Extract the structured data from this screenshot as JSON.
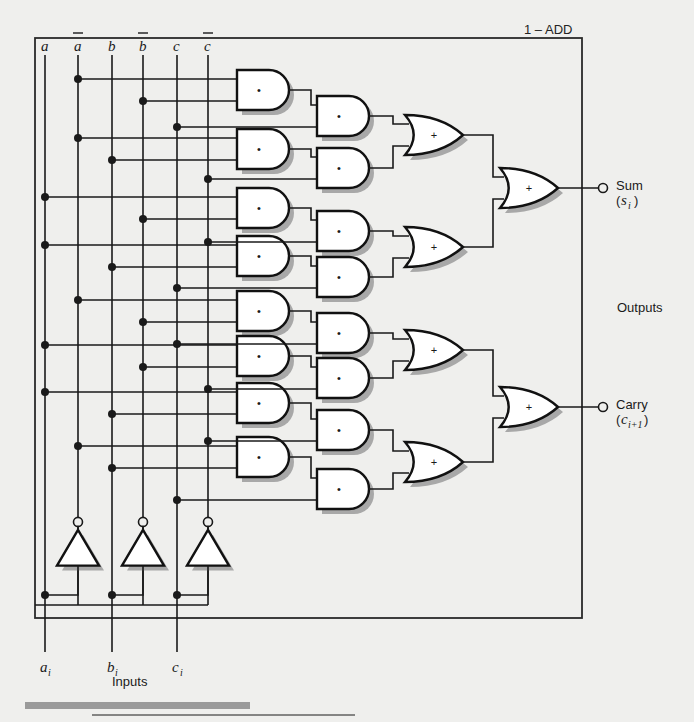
{
  "figure": {
    "title": "1 – ADD",
    "inputs_label": "Inputs",
    "outputs_label": "Outputs",
    "colors": {
      "background": "#efefed",
      "wire": "#1a1a1a",
      "gate_fill": "#ffffff",
      "gate_stroke": "#111111",
      "shadow": "#a8a8a8",
      "rule_bar": "#9a9a9a"
    }
  },
  "rails": [
    {
      "name": "a",
      "label": "a",
      "x": 45,
      "bar": false
    },
    {
      "name": "an",
      "label": "a",
      "x": 78,
      "bar": true
    },
    {
      "name": "b",
      "label": "b",
      "x": 112,
      "bar": false
    },
    {
      "name": "bn",
      "label": "b",
      "x": 143,
      "bar": true
    },
    {
      "name": "c",
      "label": "c",
      "x": 177,
      "bar": false
    },
    {
      "name": "cn",
      "label": "c",
      "x": 208,
      "bar": true
    }
  ],
  "inputs": [
    {
      "name": "a-input",
      "label": "a",
      "sub": "i",
      "x": 45
    },
    {
      "name": "b-input",
      "label": "b",
      "sub": "i",
      "x": 112
    },
    {
      "name": "c-input",
      "label": "c",
      "sub": "i",
      "x": 177
    }
  ],
  "inverters": [
    {
      "name": "inverter-a",
      "x": 78,
      "from_rail_x": 45
    },
    {
      "name": "inverter-b",
      "x": 143,
      "from_rail_x": 112
    },
    {
      "name": "inverter-c",
      "x": 208,
      "from_rail_x": 177
    }
  ],
  "outputs": [
    {
      "name": "sum-output",
      "label": "Sum",
      "sub_open": "(",
      "sub_var": "s",
      "sub_idx": "i",
      "sub_close": ")",
      "y": 188
    },
    {
      "name": "carry-output",
      "label": "Carry",
      "sub_open": "(",
      "sub_var": "c",
      "sub_idx": "i+1",
      "sub_close": ")",
      "y": 407
    }
  ],
  "and_gates_col1": [
    {
      "name": "and1-1",
      "y": 90,
      "symbol": "•",
      "in_top_rail": "an",
      "in_bot_rail": "bn"
    },
    {
      "name": "and1-2",
      "y": 149,
      "symbol": "•",
      "in_top_rail": "an",
      "in_bot_rail": "b"
    },
    {
      "name": "and1-3",
      "y": 208,
      "symbol": "•",
      "in_top_rail": "a",
      "in_bot_rail": "bn"
    },
    {
      "name": "and1-4",
      "y": 256,
      "symbol": "•",
      "in_top_rail": "a",
      "in_bot_rail": "b"
    },
    {
      "name": "and1-5",
      "y": 311,
      "symbol": "•",
      "in_top_rail": "an",
      "in_bot_rail": "bn"
    },
    {
      "name": "and1-6",
      "y": 356,
      "symbol": "•",
      "in_top_rail": "a",
      "in_bot_rail": "bn"
    },
    {
      "name": "and1-7",
      "y": 403,
      "symbol": "•",
      "in_top_rail": "a",
      "in_bot_rail": "b"
    },
    {
      "name": "and1-8",
      "y": 457,
      "symbol": "•",
      "in_top_rail": "an",
      "in_bot_rail": "b"
    }
  ],
  "and_gates_col2": [
    {
      "name": "and2-1",
      "y": 116,
      "symbol": "•",
      "in_rail": "c"
    },
    {
      "name": "and2-2",
      "y": 168,
      "symbol": "•",
      "in_rail": "cn"
    },
    {
      "name": "and2-3",
      "y": 231,
      "symbol": "•",
      "in_rail": "cn"
    },
    {
      "name": "and2-4",
      "y": 277,
      "symbol": "•",
      "in_rail": "c"
    },
    {
      "name": "and2-5",
      "y": 333,
      "symbol": "•",
      "in_rail": "c"
    },
    {
      "name": "and2-6",
      "y": 378,
      "symbol": "•",
      "in_rail": "cn"
    },
    {
      "name": "and2-7",
      "y": 430,
      "symbol": "•",
      "in_rail": "cn"
    },
    {
      "name": "and2-8",
      "y": 489,
      "symbol": "•",
      "in_rail": "c"
    }
  ],
  "or_gates_col3": [
    {
      "name": "or3-1",
      "y": 135,
      "symbol": "+"
    },
    {
      "name": "or3-2",
      "y": 247,
      "symbol": "+"
    },
    {
      "name": "or3-3",
      "y": 350,
      "symbol": "+"
    },
    {
      "name": "or3-4",
      "y": 462,
      "symbol": "+"
    }
  ],
  "or_gates_final": [
    {
      "name": "or-final-sum",
      "y": 188,
      "symbol": "+"
    },
    {
      "name": "or-final-carry",
      "y": 407,
      "symbol": "+"
    }
  ],
  "junctions": [
    {
      "rail": "an",
      "y": 90
    },
    {
      "rail": "bn",
      "y": 105
    },
    {
      "rail": "c",
      "y": 117
    },
    {
      "rail": "an",
      "y": 137
    },
    {
      "rail": "b",
      "y": 152
    },
    {
      "rail": "cn",
      "y": 170
    },
    {
      "rail": "a",
      "y": 190
    },
    {
      "rail": "bn",
      "y": 206
    },
    {
      "rail": "cn",
      "y": 227
    },
    {
      "rail": "a",
      "y": 245
    },
    {
      "rail": "b",
      "y": 261
    },
    {
      "rail": "c",
      "y": 279
    },
    {
      "rail": "an",
      "y": 300
    },
    {
      "rail": "bn",
      "y": 315
    },
    {
      "rail": "c",
      "y": 337
    },
    {
      "rail": "a",
      "y": 352
    },
    {
      "rail": "bn",
      "y": 367
    },
    {
      "rail": "cn",
      "y": 381
    },
    {
      "rail": "a",
      "y": 400
    },
    {
      "rail": "b",
      "y": 418
    },
    {
      "rail": "cn",
      "y": 432
    },
    {
      "rail": "an",
      "y": 455
    },
    {
      "rail": "b",
      "y": 470
    },
    {
      "rail": "c",
      "y": 492
    }
  ],
  "geometry": {
    "frame": {
      "x": 35,
      "y": 38,
      "w": 547,
      "h": 580
    },
    "rail_top": 55,
    "rail_bottom": 605,
    "inverter_y": 553,
    "inverter_size": 42,
    "and1_x": 237,
    "and2_x": 317,
    "or3_x": 405,
    "orf_x": 500,
    "gate_w": 52,
    "gate_h": 40,
    "output_node_x": 603,
    "rule_bar": {
      "x": 25,
      "y": 702,
      "w": 225,
      "h": 7
    },
    "rule_line": {
      "x1": 92,
      "y1": 715,
      "x2": 355,
      "y2": 715
    }
  }
}
